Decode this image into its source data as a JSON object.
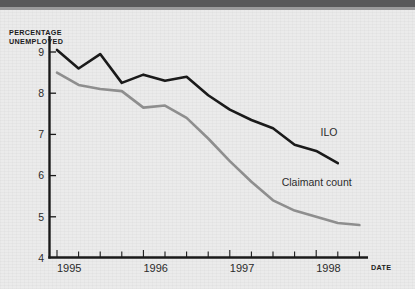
{
  "chart_data": {
    "type": "line",
    "title": "",
    "xlabel": "DATE",
    "ylabel": "PERCENTAGE UNEMPLOYED",
    "ylabel_line1": "PERCENTAGE",
    "ylabel_line2": "UNEMPLOYED",
    "ylim": [
      4,
      9.4
    ],
    "yticks": [
      4,
      5,
      6,
      7,
      8,
      9
    ],
    "ytick_labels": [
      "4",
      "5",
      "6",
      "7",
      "8",
      "9"
    ],
    "xlim": [
      1995.0,
      1998.85
    ],
    "xticks": [
      1995,
      1996,
      1997,
      1998
    ],
    "xtick_labels": [
      "1995",
      "1996",
      "1997",
      "1998"
    ],
    "minor_xticks_per_year": 4,
    "grid": false,
    "legend": "inline-annotations",
    "x": [
      1995.0,
      1995.25,
      1995.5,
      1995.75,
      1996.0,
      1996.25,
      1996.5,
      1996.75,
      1997.0,
      1997.25,
      1997.5,
      1997.75,
      1998.0,
      1998.25,
      1998.5,
      1998.75
    ],
    "series": [
      {
        "name": "ILO",
        "color": "#1a1a1a",
        "label_position": {
          "x": 1998.05,
          "y": 6.95
        },
        "values": [
          9.05,
          8.6,
          8.95,
          8.25,
          8.45,
          8.3,
          8.4,
          7.95,
          7.6,
          7.35,
          7.15,
          6.75,
          6.6,
          6.3,
          null,
          null
        ]
      },
      {
        "name": "Claimant count",
        "color": "#8e8e8e",
        "label_position": {
          "x": 1997.6,
          "y": 5.75
        },
        "values": [
          8.5,
          8.2,
          8.1,
          8.05,
          7.65,
          7.7,
          7.4,
          6.9,
          6.35,
          5.85,
          5.4,
          5.15,
          5.0,
          4.85,
          4.8,
          null
        ]
      }
    ]
  },
  "axis": {
    "y_title_line1": "PERCENTAGE",
    "y_title_line2": "UNEMPLOYED",
    "x_title": "DATE"
  }
}
